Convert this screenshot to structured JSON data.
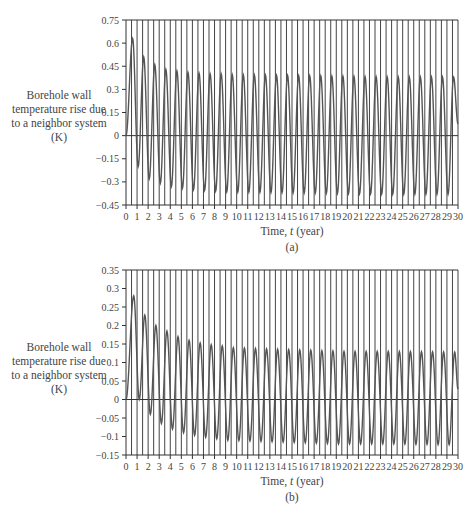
{
  "chart_data": [
    {
      "type": "line",
      "panel": "(a)",
      "title": "",
      "xlabel": "Time, t (year)",
      "ylabel": "Borehole wall temperature rise due to a neighbor system (K)",
      "xlim": [
        0,
        30
      ],
      "ylim": [
        -0.45,
        0.75
      ],
      "yticks": [
        0.75,
        0.6,
        0.45,
        0.3,
        0.15,
        0,
        -0.15,
        -0.3,
        -0.45
      ],
      "ytick_labels": [
        "0.75",
        "0.6",
        "0.45",
        "0.3",
        "0.15",
        "0",
        "-0.15",
        "-0.3",
        "-0.45"
      ],
      "xticks": [
        0,
        1,
        2,
        3,
        4,
        5,
        6,
        7,
        8,
        9,
        10,
        11,
        12,
        13,
        14,
        15,
        16,
        17,
        18,
        19,
        20,
        21,
        22,
        23,
        24,
        25,
        26,
        27,
        28,
        29,
        30
      ],
      "grid": "vertical lines every 0.5 year",
      "caption": "(a)",
      "series": [
        {
          "name": "temperature rise",
          "description": "annual oscillation; peaks near t=n+0.6, troughs near t=n+1.1",
          "peaks": [
            {
              "t": 0.6,
              "v": 0.63
            },
            {
              "t": 1.6,
              "v": 0.51
            },
            {
              "t": 2.6,
              "v": 0.46
            },
            {
              "t": 3.6,
              "v": 0.43
            },
            {
              "t": 4.6,
              "v": 0.42
            },
            {
              "t": 5.6,
              "v": 0.41
            },
            {
              "t": 6.6,
              "v": 0.405
            },
            {
              "t": 7.6,
              "v": 0.4
            },
            {
              "t": 8.6,
              "v": 0.4
            },
            {
              "t": 9.6,
              "v": 0.395
            },
            {
              "t": 14.6,
              "v": 0.39
            },
            {
              "t": 19.6,
              "v": 0.385
            },
            {
              "t": 24.6,
              "v": 0.38
            },
            {
              "t": 29.6,
              "v": 0.38
            }
          ],
          "troughs": [
            {
              "t": 1.1,
              "v": -0.2
            },
            {
              "t": 2.1,
              "v": -0.28
            },
            {
              "t": 3.1,
              "v": -0.31
            },
            {
              "t": 4.1,
              "v": -0.33
            },
            {
              "t": 5.1,
              "v": -0.34
            },
            {
              "t": 6.1,
              "v": -0.35
            },
            {
              "t": 7.1,
              "v": -0.355
            },
            {
              "t": 8.1,
              "v": -0.36
            },
            {
              "t": 9.1,
              "v": -0.365
            },
            {
              "t": 14.1,
              "v": -0.37
            },
            {
              "t": 19.1,
              "v": -0.375
            },
            {
              "t": 24.1,
              "v": -0.38
            },
            {
              "t": 29.1,
              "v": -0.38
            }
          ]
        }
      ]
    },
    {
      "type": "line",
      "panel": "(b)",
      "title": "",
      "xlabel": "Time, t (year)",
      "ylabel": "Borehole wall temperature rise due to a neighbor system (K)",
      "xlim": [
        0,
        30
      ],
      "ylim": [
        -0.15,
        0.35
      ],
      "yticks": [
        0.35,
        0.3,
        0.25,
        0.2,
        0.15,
        0.1,
        0.05,
        0,
        -0.05,
        -0.1,
        -0.15
      ],
      "ytick_labels": [
        "0.35",
        "0.3",
        "0.25",
        "0.2",
        "0.15",
        "0.1",
        "0.05",
        "0",
        "-0.05",
        "-0.1",
        "-0.15"
      ],
      "xticks": [
        0,
        1,
        2,
        3,
        4,
        5,
        6,
        7,
        8,
        9,
        10,
        11,
        12,
        13,
        14,
        15,
        16,
        17,
        18,
        19,
        20,
        21,
        22,
        23,
        24,
        25,
        26,
        27,
        28,
        29,
        30
      ],
      "grid": "vertical lines every 0.5 year",
      "caption": "(b)",
      "series": [
        {
          "name": "temperature rise",
          "description": "annual oscillation with decaying offset; peaks near t=n+0.7, troughs near t=n+1.2",
          "peaks": [
            {
              "t": 0.7,
              "v": 0.28
            },
            {
              "t": 1.7,
              "v": 0.228
            },
            {
              "t": 2.7,
              "v": 0.2
            },
            {
              "t": 3.7,
              "v": 0.185
            },
            {
              "t": 4.7,
              "v": 0.17
            },
            {
              "t": 5.7,
              "v": 0.16
            },
            {
              "t": 6.7,
              "v": 0.153
            },
            {
              "t": 7.7,
              "v": 0.148
            },
            {
              "t": 8.7,
              "v": 0.145
            },
            {
              "t": 9.7,
              "v": 0.14
            },
            {
              "t": 14.7,
              "v": 0.135
            },
            {
              "t": 19.7,
              "v": 0.13
            },
            {
              "t": 24.7,
              "v": 0.13
            },
            {
              "t": 29.7,
              "v": 0.128
            }
          ],
          "troughs": [
            {
              "t": 1.2,
              "v": 0.0
            },
            {
              "t": 2.2,
              "v": -0.04
            },
            {
              "t": 3.2,
              "v": -0.065
            },
            {
              "t": 4.2,
              "v": -0.08
            },
            {
              "t": 5.2,
              "v": -0.09
            },
            {
              "t": 6.2,
              "v": -0.097
            },
            {
              "t": 7.2,
              "v": -0.102
            },
            {
              "t": 8.2,
              "v": -0.106
            },
            {
              "t": 9.2,
              "v": -0.11
            },
            {
              "t": 14.2,
              "v": -0.115
            },
            {
              "t": 19.2,
              "v": -0.12
            },
            {
              "t": 24.2,
              "v": -0.12
            },
            {
              "t": 29.2,
              "v": -0.122
            }
          ]
        }
      ]
    }
  ],
  "panels": {
    "a": {
      "ylabel_lines": [
        "Borehole wall",
        "temperature rise due",
        "to a neighbor system",
        "(K)"
      ],
      "xlabel": "Time, t (year)",
      "xlabel_prefix": "Time, ",
      "xlabel_var": "t",
      "xlabel_suffix": " (year)",
      "caption": "(a)"
    },
    "b": {
      "ylabel_lines": [
        "Borehole wall",
        "temperature rise due",
        "to a neighbor system",
        "(K)"
      ],
      "xlabel": "Time, t (year)",
      "xlabel_prefix": "Time, ",
      "xlabel_var": "t",
      "xlabel_suffix": " (year)",
      "caption": "(b)"
    }
  },
  "colors": {
    "curve": "#555555",
    "grid": "#444444",
    "axis": "#333333",
    "text": "#444444"
  }
}
